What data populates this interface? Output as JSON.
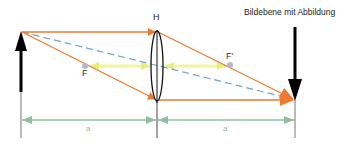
{
  "diagram": {
    "title": "Bildebene mit Abbildung",
    "labels": {
      "principal_plane": "H",
      "focal_point_object": "F",
      "focal_point_image": "F'",
      "object_distance": "a",
      "image_distance": "a'"
    },
    "colors": {
      "ray": "#ef7a2f",
      "center_ray_dashed": "#6fa3c8",
      "focal_length_arrow": "#eef5a0",
      "dimension_arrow": "#8fbf9f",
      "arrows_black": "#000000",
      "baseline_gray": "#666666",
      "focal_dot": "#b8b8c8"
    },
    "elements": {
      "object_arrow": {
        "x": 20,
        "tip_y": 32,
        "base_y": 135,
        "direction": "up"
      },
      "lens": {
        "x": 157,
        "top_y": 30,
        "bottom_y": 103,
        "type": "convex"
      },
      "image_arrow": {
        "x": 295,
        "tip_y": 100,
        "top_y": 27,
        "direction": "down"
      },
      "focal_F": {
        "x": 85,
        "y": 66
      },
      "focal_F_prime": {
        "x": 230,
        "y": 65
      }
    }
  }
}
